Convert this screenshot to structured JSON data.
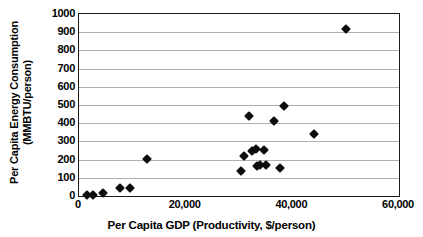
{
  "chart_data": {
    "type": "scatter",
    "title": "",
    "xlabel": "Per Capita GDP (Productivity, $/person)",
    "ylabel_line1": "Per Capita Energy Consumption",
    "ylabel_line2": "(MMBTU/person)",
    "xlim": [
      0,
      60000
    ],
    "ylim": [
      0,
      1000
    ],
    "xticks": [
      0,
      20000,
      40000,
      60000
    ],
    "xtick_labels": [
      "0",
      "20,000",
      "40,000",
      "60,000"
    ],
    "yticks": [
      0,
      100,
      200,
      300,
      400,
      500,
      600,
      700,
      800,
      900,
      1000
    ],
    "ytick_labels": [
      "0",
      "100",
      "200",
      "300",
      "400",
      "500",
      "600",
      "700",
      "800",
      "900",
      "1000"
    ],
    "grid": "horizontal",
    "legend": "none",
    "marker": "diamond",
    "marker_color": "#0d0d0d",
    "series": [
      {
        "name": "Countries",
        "points": [
          {
            "x": 1500,
            "y": 5
          },
          {
            "x": 2600,
            "y": 5
          },
          {
            "x": 4500,
            "y": 18
          },
          {
            "x": 7600,
            "y": 42
          },
          {
            "x": 9600,
            "y": 44
          },
          {
            "x": 12800,
            "y": 205
          },
          {
            "x": 30400,
            "y": 138
          },
          {
            "x": 31000,
            "y": 218
          },
          {
            "x": 31800,
            "y": 440
          },
          {
            "x": 32500,
            "y": 248
          },
          {
            "x": 33100,
            "y": 258
          },
          {
            "x": 33400,
            "y": 165
          },
          {
            "x": 34000,
            "y": 168
          },
          {
            "x": 34600,
            "y": 255
          },
          {
            "x": 35100,
            "y": 168
          },
          {
            "x": 36500,
            "y": 412
          },
          {
            "x": 37600,
            "y": 155
          },
          {
            "x": 38500,
            "y": 493
          },
          {
            "x": 44000,
            "y": 338
          },
          {
            "x": 50000,
            "y": 920
          }
        ]
      }
    ]
  }
}
